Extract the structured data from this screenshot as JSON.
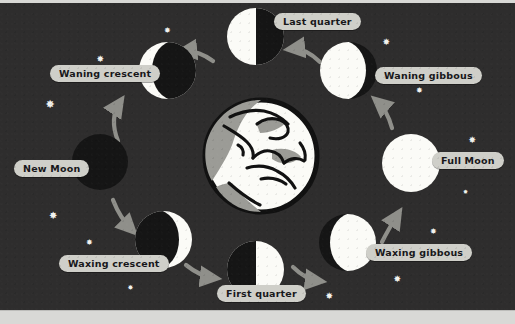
{
  "diagram": {
    "background_color": "#2e2d2d",
    "label_bg_color": "#cfcfc9",
    "label_text_color": "#17171a",
    "moon_lit_color": "#fbfbf7",
    "moon_dark_color": "#151515",
    "arrow_color": "#8f8f8a",
    "star_color": "#f2f2ee",
    "center_body": "earth"
  },
  "labels": {
    "last_quarter": "Last quarter",
    "waning_gibbous": "Waning gibbous",
    "full_moon": "Full Moon",
    "waxing_gibbous": "Waxing gibbous",
    "first_quarter": "First quarter",
    "waxing_crescent": "Waxing crescent",
    "new_moon": "New Moon",
    "waning_crescent": "Waning crescent"
  },
  "phases": [
    {
      "id": "last-quarter",
      "label": "Last quarter",
      "illumination": "50% left lit",
      "position": "top"
    },
    {
      "id": "waning-gibbous",
      "label": "Waning gibbous",
      "illumination": "gibbous left lit",
      "position": "top-right"
    },
    {
      "id": "full-moon",
      "label": "Full Moon",
      "illumination": "100% lit",
      "position": "right"
    },
    {
      "id": "waxing-gibbous",
      "label": "Waxing gibbous",
      "illumination": "gibbous right lit",
      "position": "bottom-right"
    },
    {
      "id": "first-quarter",
      "label": "First quarter",
      "illumination": "50% right lit",
      "position": "bottom"
    },
    {
      "id": "waxing-crescent",
      "label": "Waxing crescent",
      "illumination": "crescent right lit",
      "position": "bottom-left"
    },
    {
      "id": "new-moon",
      "label": "New Moon",
      "illumination": "0% lit",
      "position": "left"
    },
    {
      "id": "waning-crescent",
      "label": "Waning crescent",
      "illumination": "crescent left lit",
      "position": "top-left"
    }
  ],
  "stars": [
    {
      "x": 168,
      "y": 31,
      "size": 8
    },
    {
      "x": 101,
      "y": 59,
      "size": 9
    },
    {
      "x": 51,
      "y": 104,
      "size": 11
    },
    {
      "x": 54,
      "y": 216,
      "size": 10
    },
    {
      "x": 90,
      "y": 243,
      "size": 8
    },
    {
      "x": 131,
      "y": 288,
      "size": 7
    },
    {
      "x": 330,
      "y": 296,
      "size": 9
    },
    {
      "x": 398,
      "y": 279,
      "size": 9
    },
    {
      "x": 434,
      "y": 232,
      "size": 8
    },
    {
      "x": 473,
      "y": 140,
      "size": 9
    },
    {
      "x": 466,
      "y": 192,
      "size": 6
    },
    {
      "x": 420,
      "y": 91,
      "size": 8
    },
    {
      "x": 387,
      "y": 42,
      "size": 9
    }
  ],
  "arrows": [
    {
      "from": "waning-crescent",
      "to": "last-quarter",
      "direction": "counterclockwise"
    },
    {
      "from": "last-quarter",
      "to": "waning-gibbous",
      "direction": "counterclockwise"
    },
    {
      "from": "waning-gibbous",
      "to": "full-moon",
      "direction": "counterclockwise"
    },
    {
      "from": "full-moon",
      "to": "waxing-gibbous",
      "direction": "counterclockwise"
    },
    {
      "from": "waxing-gibbous",
      "to": "first-quarter",
      "direction": "counterclockwise"
    },
    {
      "from": "first-quarter",
      "to": "waxing-crescent",
      "direction": "counterclockwise"
    },
    {
      "from": "waxing-crescent",
      "to": "new-moon",
      "direction": "counterclockwise"
    },
    {
      "from": "new-moon",
      "to": "waning-crescent",
      "direction": "counterclockwise"
    }
  ]
}
